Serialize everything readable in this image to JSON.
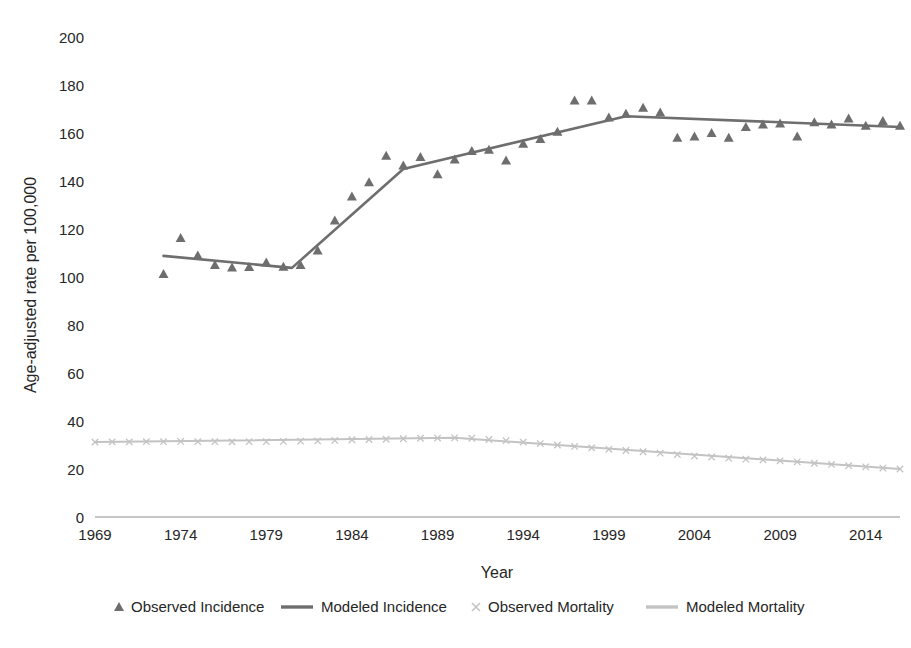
{
  "chart_data": {
    "type": "line",
    "title": "",
    "xlabel": "Year",
    "ylabel": "Age-adjusted rate per 100,000",
    "xlim": [
      1969,
      2016
    ],
    "ylim": [
      0,
      200
    ],
    "yticks": [
      0,
      20,
      40,
      60,
      80,
      100,
      120,
      140,
      160,
      180,
      200
    ],
    "xticks": [
      1969,
      1974,
      1979,
      1984,
      1989,
      1994,
      1999,
      2004,
      2009,
      2014
    ],
    "grid": false,
    "legend_position": "bottom",
    "colors": {
      "incidence": "#6e6e6e",
      "mortality": "#c3c3c3",
      "text": "#262626",
      "axis": "#8c8c8c"
    },
    "series": [
      {
        "name": "Observed Incidence",
        "marker": "triangle",
        "style": "points",
        "color": "#6e6e6e",
        "x": [
          1973,
          1974,
          1975,
          1976,
          1977,
          1978,
          1979,
          1980,
          1981,
          1982,
          1983,
          1984,
          1985,
          1986,
          1987,
          1988,
          1989,
          1990,
          1991,
          1992,
          1993,
          1994,
          1995,
          1996,
          1997,
          1998,
          1999,
          2000,
          2001,
          2002,
          2003,
          2004,
          2005,
          2006,
          2007,
          2008,
          2009,
          2010,
          2011,
          2012,
          2013,
          2014,
          2015,
          2016
        ],
        "y": [
          101.2,
          116.3,
          109.0,
          105.0,
          104.0,
          104.2,
          106.0,
          104.3,
          105.0,
          111.0,
          123.5,
          133.5,
          139.5,
          150.5,
          146.5,
          150.0,
          142.8,
          149.0,
          152.5,
          153.0,
          148.5,
          155.5,
          157.5,
          160.5,
          173.5,
          173.5,
          166.5,
          168.0,
          170.5,
          168.5,
          158.0,
          158.5,
          160.0,
          158.0,
          162.5,
          163.5,
          164.0,
          158.5,
          164.5,
          163.5,
          166.0,
          163.0,
          165.0,
          163.0
        ]
      },
      {
        "name": "Modeled Incidence",
        "marker": "none",
        "style": "line",
        "color": "#6e6e6e",
        "x": [
          1973,
          1980.5,
          1987,
          2000,
          2016
        ],
        "y": [
          108.8,
          103.8,
          145.0,
          167.0,
          162.5
        ]
      },
      {
        "name": "Observed Mortality",
        "marker": "cross",
        "style": "points",
        "color": "#c3c3c3",
        "x": [
          1969,
          1970,
          1971,
          1972,
          1973,
          1974,
          1975,
          1976,
          1977,
          1978,
          1979,
          1980,
          1981,
          1982,
          1983,
          1984,
          1985,
          1986,
          1987,
          1988,
          1989,
          1990,
          1991,
          1992,
          1993,
          1994,
          1995,
          1996,
          1997,
          1998,
          1999,
          2000,
          2001,
          2002,
          2003,
          2004,
          2005,
          2006,
          2007,
          2008,
          2009,
          2010,
          2011,
          2012,
          2013,
          2014,
          2015,
          2016
        ],
        "y": [
          31.2,
          31.3,
          31.3,
          31.4,
          31.4,
          31.5,
          31.4,
          31.4,
          31.3,
          31.4,
          31.4,
          31.5,
          31.6,
          31.7,
          31.9,
          32.2,
          32.3,
          32.4,
          32.6,
          32.8,
          32.9,
          33.0,
          32.8,
          32.3,
          31.8,
          31.2,
          30.6,
          30.0,
          29.4,
          28.8,
          28.2,
          27.7,
          27.2,
          26.6,
          26.0,
          25.4,
          25.0,
          24.5,
          24.1,
          23.8,
          23.4,
          23.0,
          22.4,
          21.9,
          21.4,
          20.9,
          20.4,
          20.0
        ]
      },
      {
        "name": "Modeled Mortality",
        "marker": "none",
        "style": "line",
        "color": "#c3c3c3",
        "x": [
          1969,
          1990,
          2016
        ],
        "y": [
          31.2,
          33.0,
          20.0
        ]
      }
    ]
  },
  "legend": {
    "items": [
      {
        "label": "Observed Incidence",
        "symbol": "triangle",
        "color": "#6e6e6e"
      },
      {
        "label": "Modeled Incidence",
        "symbol": "line",
        "color": "#6e6e6e"
      },
      {
        "label": "Observed Mortality",
        "symbol": "cross",
        "color": "#c3c3c3"
      },
      {
        "label": "Modeled Mortality",
        "symbol": "line",
        "color": "#c3c3c3"
      }
    ]
  }
}
